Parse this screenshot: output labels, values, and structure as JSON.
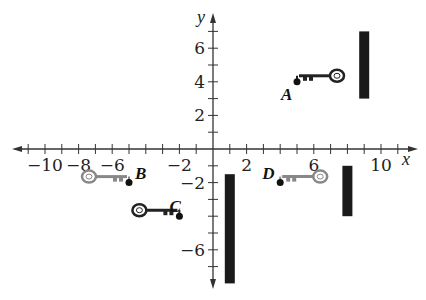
{
  "chart_data": {
    "type": "coordinate-plane",
    "xlabel": "x",
    "ylabel": "y",
    "xlim": [
      -12,
      12
    ],
    "ylim": [
      -8,
      8
    ],
    "x_tick_labels": [
      "-10",
      "-8",
      "-6",
      "-2",
      "2",
      "6",
      "10"
    ],
    "x_tick_values": [
      -10,
      -8,
      -6,
      -2,
      2,
      6,
      10
    ],
    "y_tick_labels": [
      "6",
      "4",
      "2",
      "-2",
      "-6"
    ],
    "y_tick_values": [
      6,
      4,
      2,
      -2,
      -6
    ],
    "points": [
      {
        "label": "A",
        "x": 5,
        "y": 4,
        "key_color": "#222222",
        "key_direction": "right"
      },
      {
        "label": "B",
        "x": -5,
        "y": -2,
        "key_color": "#888888",
        "key_direction": "left"
      },
      {
        "label": "C",
        "x": -2,
        "y": -4,
        "key_color": "#222222",
        "key_direction": "left"
      },
      {
        "label": "D",
        "x": 4,
        "y": -2,
        "key_color": "#888888",
        "key_direction": "right"
      }
    ],
    "bars": [
      {
        "x": 9,
        "y_top": 7,
        "y_bottom": 3
      },
      {
        "x": 1,
        "y_top": -1.5,
        "y_bottom": -8
      },
      {
        "x": 8,
        "y_top": -1,
        "y_bottom": -4
      }
    ]
  }
}
